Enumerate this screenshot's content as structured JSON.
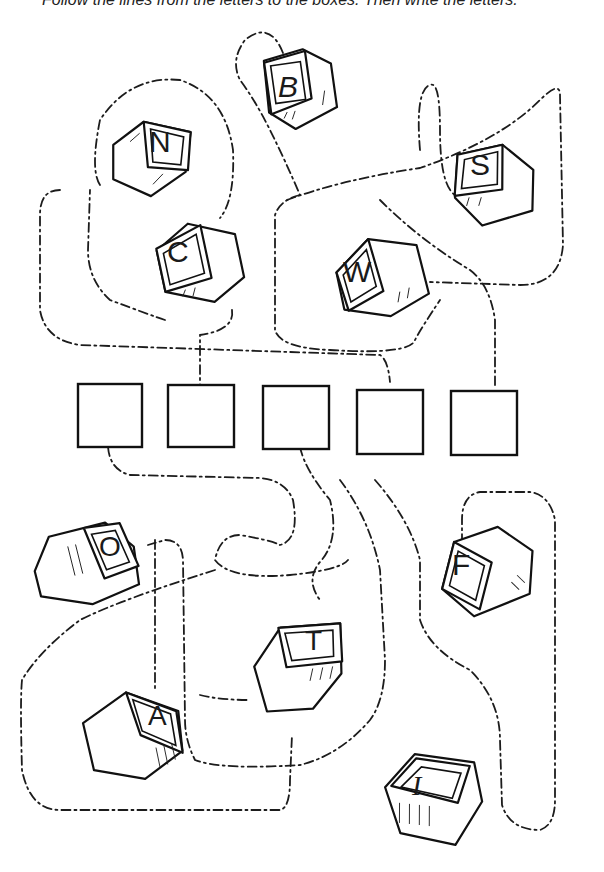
{
  "instruction": "Follow the lines from the letters to the boxes. Then write the letters.",
  "blocks": [
    {
      "letter": "B",
      "cx": 300,
      "cy": 88
    },
    {
      "letter": "N",
      "cx": 148,
      "cy": 155
    },
    {
      "letter": "S",
      "cx": 493,
      "cy": 183
    },
    {
      "letter": "C",
      "cx": 200,
      "cy": 262
    },
    {
      "letter": "W",
      "cx": 382,
      "cy": 275
    },
    {
      "letter": "O",
      "cx": 92,
      "cy": 561
    },
    {
      "letter": "F",
      "cx": 485,
      "cy": 572
    },
    {
      "letter": "T",
      "cx": 298,
      "cy": 662
    },
    {
      "letter": "A",
      "cx": 132,
      "cy": 730
    },
    {
      "letter": "I",
      "cx": 430,
      "cy": 800
    }
  ],
  "answer_boxes": [
    {
      "index": 1,
      "value": ""
    },
    {
      "index": 2,
      "value": ""
    },
    {
      "index": 3,
      "value": ""
    },
    {
      "index": 4,
      "value": ""
    },
    {
      "index": 5,
      "value": ""
    }
  ],
  "colors": {
    "ink": "#111111",
    "paper": "#ffffff"
  }
}
